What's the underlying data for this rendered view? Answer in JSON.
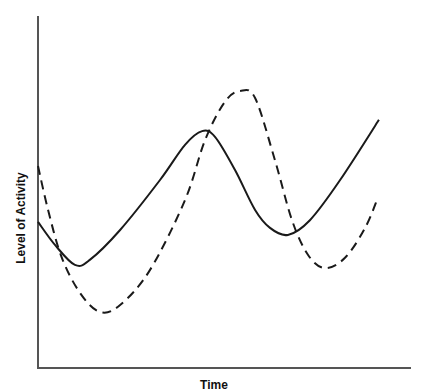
{
  "chart_data": {
    "type": "line",
    "title": "",
    "xlabel": "Time",
    "ylabel": "Level of Activity",
    "xlim": [
      0,
      10
    ],
    "ylim": [
      0,
      10
    ],
    "grid": false,
    "legend": null,
    "ticks": {
      "x": [],
      "y": []
    },
    "series": [
      {
        "name": "solid-curve",
        "style": "solid",
        "color": "#1a1a1a",
        "x": [
          0,
          0.46,
          0.99,
          1.39,
          2.2,
          3.27,
          3.94,
          4.4,
          4.75,
          5.28,
          5.82,
          6.22,
          6.7,
          7.29,
          8.1,
          9.14
        ],
        "y": [
          4.15,
          3.49,
          2.93,
          3.07,
          3.92,
          5.34,
          6.34,
          6.73,
          6.56,
          5.63,
          4.49,
          3.98,
          3.78,
          4.2,
          5.34,
          7.05
        ]
      },
      {
        "name": "dashed-curve",
        "style": "dashed",
        "color": "#1a1a1a",
        "x": [
          0,
          0.27,
          0.64,
          1.13,
          1.66,
          2.2,
          3.0,
          3.94,
          4.48,
          5.01,
          5.42,
          5.82,
          6.35,
          6.81,
          7.24,
          7.69,
          8.23,
          8.77,
          9.12
        ],
        "y": [
          5.74,
          4.49,
          3.13,
          2.13,
          1.59,
          1.79,
          2.78,
          4.77,
          6.48,
          7.56,
          7.87,
          7.67,
          5.91,
          4.2,
          3.21,
          2.84,
          3.13,
          3.98,
          4.86
        ]
      }
    ]
  },
  "layout": {
    "plot_left_px": 38,
    "plot_right_px": 411,
    "plot_top_px": 16,
    "plot_bottom_px": 368,
    "axis_color": "#555555"
  }
}
